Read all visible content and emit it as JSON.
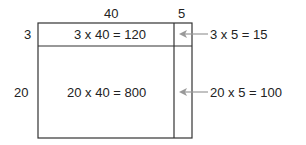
{
  "diagram": {
    "top_labels": {
      "width_large": "40",
      "width_small": "5"
    },
    "side_labels": {
      "height_small": "3",
      "height_large": "20"
    },
    "cells": {
      "top_left": "3 x 40 = 120",
      "bottom_left": "20 x 40 = 800"
    },
    "callouts": {
      "top_right": "3 x 5 = 15",
      "bottom_right": "20 x 5 = 100"
    },
    "colors": {
      "line": "#333333",
      "arrow": "#999999",
      "text": "#222222"
    }
  }
}
